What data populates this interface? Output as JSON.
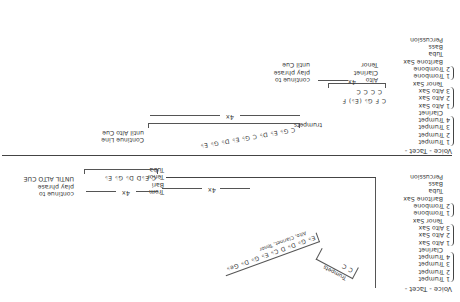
{
  "document": {
    "type": "handwritten arrangement sheet (scanned, rotated 180°)",
    "section_a": {
      "heading": "Voice - Tacet -",
      "instruments": [
        {
          "label": "1 Trumpet"
        },
        {
          "label": "2 Trumpet"
        },
        {
          "label": "3 Trumpet"
        },
        {
          "label": "4 Trumpet"
        },
        {
          "label": "Clarinet"
        },
        {
          "label": "1 Alto Sax"
        },
        {
          "label": "2 Alto Sax"
        },
        {
          "label": "3 Alto Sax"
        },
        {
          "label": "Tenor Sax"
        },
        {
          "label": "1 Trombone"
        },
        {
          "label": "2 Trombone"
        },
        {
          "label": "Baritone Sax"
        },
        {
          "label": "Tuba"
        },
        {
          "label": "Bass"
        },
        {
          "label": "Percussion"
        }
      ],
      "trumpet_figure": {
        "label": "Trumpets",
        "notes": "C   C"
      },
      "diagonal_phrase": {
        "notes": "E♭ G♭ D♭ D  C♭ E♭ G♭ D♭ Ge♭",
        "parts": "Alto, Clarinet, Tenor"
      },
      "repeat": "4x",
      "tenor_bari_group": {
        "labels": [
          "Trom",
          "Bari",
          "Tenor",
          "Tuba"
        ],
        "notes": "C   E♭D  D♭  G♭ E♭",
        "repeat": "4x"
      },
      "instruction": [
        "continue to",
        "play phrase",
        "UNTIL ALTO CUE"
      ]
    },
    "section_b": {
      "heading": "Voice - Tacet -",
      "instruments": [
        {
          "label": "1 Trumpet"
        },
        {
          "label": "2 Trumpet"
        },
        {
          "label": "3 Trumpet"
        },
        {
          "label": "4 Trumpet"
        },
        {
          "label": "Clarinet"
        },
        {
          "label": "1 Alto Sax"
        },
        {
          "label": "2 Alto Sax"
        },
        {
          "label": "3 Alto Sax"
        },
        {
          "label": "Tenor Sax"
        },
        {
          "label": "1 Trombone"
        },
        {
          "label": "2 Trombone"
        },
        {
          "label": "Baritone Sax"
        },
        {
          "label": "Tuba"
        },
        {
          "label": "Bass"
        },
        {
          "label": "Percussion"
        }
      ],
      "alto_group": {
        "labels": [
          "Alto",
          "Clarinet",
          "Tenor"
        ],
        "notes": "C  F  G♭  (E♭) F",
        "accents": "C   C   C  C",
        "repeat": "4x",
        "instruction": [
          "continue to",
          "play phrase",
          "until Cue"
        ]
      },
      "trumpet_group": {
        "label": "trumpets",
        "notes": "C  G♭  E♭  D♭  C  G♭  E♭  D♭  G♭  E♭",
        "repeat": "4x",
        "instruction": [
          "Continue Line",
          "until Alto Cue"
        ]
      }
    }
  }
}
